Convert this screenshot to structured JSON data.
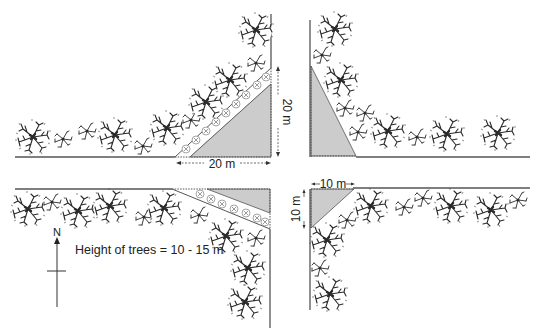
{
  "diagram": {
    "type": "road-intersection-visibility-corners",
    "colors": {
      "road_edge": "#555555",
      "sight_triangle_fill": "#cccccc",
      "tree_ink": "#2a2a2a",
      "text": "#222222"
    },
    "labels": {
      "nw_horizontal_dim": "20 m",
      "nw_vertical_dim": "20 m",
      "se_horizontal_dim": "10 m",
      "se_vertical_dim": "10 m",
      "tree_height_note": "Height of trees = 10 - 15 m",
      "north_arrow": "N"
    },
    "quadrants": [
      {
        "id": "north-west",
        "sight_triangle": "20 m x 20 m",
        "shrub_strip": true
      },
      {
        "id": "north-east",
        "sight_triangle": "small",
        "shrub_strip": false
      },
      {
        "id": "south-west",
        "sight_triangle": "shallow",
        "shrub_strip": true
      },
      {
        "id": "south-east",
        "sight_triangle": "10 m x 10 m",
        "shrub_strip": false
      }
    ]
  }
}
